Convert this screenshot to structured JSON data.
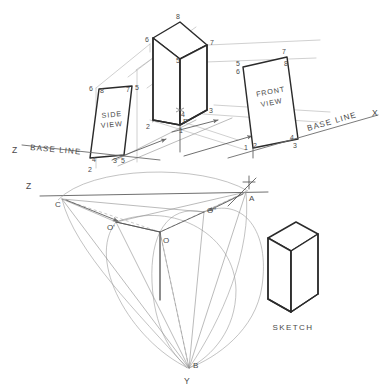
{
  "drawing": {
    "title": "Axonometric projection construction",
    "background_color": "#ffffff",
    "line_color": "#2b2b2b",
    "construction_color": "#9a9a9a"
  },
  "views": {
    "side_view": {
      "label": "SIDE\nVIEW",
      "label_line1": "SIDE",
      "label_line2": "VIEW",
      "corner_numbers": [
        "6",
        "8",
        "7",
        "5",
        "4",
        "3",
        "5",
        "2"
      ]
    },
    "front_view": {
      "label_line1": "FRONT",
      "label_line2": "VIEW",
      "corner_numbers": [
        "5",
        "6",
        "7",
        "8",
        "1",
        "2",
        "4",
        "3"
      ]
    },
    "sketch": {
      "label": "SKETCH"
    }
  },
  "prism": {
    "vertex_labels": [
      "1",
      "2",
      "3",
      "4",
      "5",
      "6",
      "7",
      "8"
    ],
    "center_point": "P"
  },
  "base_lines": {
    "left": {
      "axis": "Z",
      "text": "BASE  LINE"
    },
    "right": {
      "text": "BASE  LINE",
      "axis": "X"
    }
  },
  "construction": {
    "axis_z": "Z",
    "axis_x": "X",
    "axis_y": "Y",
    "points": [
      {
        "id": "A",
        "label": "A"
      },
      {
        "id": "B",
        "label": "B"
      },
      {
        "id": "C",
        "label": "C"
      },
      {
        "id": "O",
        "label": "O"
      },
      {
        "id": "O1",
        "label": "O'"
      },
      {
        "id": "O2",
        "label": "O\""
      }
    ]
  }
}
